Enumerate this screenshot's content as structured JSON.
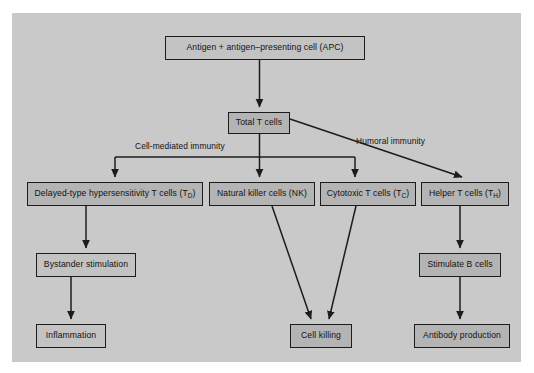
{
  "diagram": {
    "canvas_color": "#c9c9c9",
    "page_color": "#ffffff",
    "node_fill": "#b4b4b4",
    "node_border": "#1c1c1c",
    "text_color": "#111111"
  },
  "nodes": {
    "apc": {
      "label": "Antigen + antigen–presenting cell (APC)",
      "x": 165,
      "y": 36,
      "w": 200,
      "h": 24
    },
    "total_t": {
      "label": "Total T cells",
      "x": 228,
      "y": 112,
      "w": 62,
      "h": 22
    },
    "delayed_type": {
      "label_main": "Delayed-type hypersensitivity T cells (T",
      "label_sub": "D",
      "label_tail": ")",
      "label_full": "Delayed-type hypersensitivity T cells (TD)",
      "x": 27,
      "y": 182,
      "w": 176,
      "h": 24
    },
    "natural_killer": {
      "label": "Natural killer cells (NK)",
      "x": 209,
      "y": 182,
      "w": 106,
      "h": 24
    },
    "cytotoxic": {
      "label_main": "Cytotoxic T cells (T",
      "label_sub": "C",
      "label_tail": ")",
      "label_full": "Cytotoxic T cells (TC)",
      "x": 320,
      "y": 182,
      "w": 96,
      "h": 24
    },
    "helper": {
      "label_main": "Helper T cells (T",
      "label_sub": "H",
      "label_tail": ")",
      "label_full": "Helper T cells (TH)",
      "x": 421,
      "y": 182,
      "w": 88,
      "h": 24
    },
    "bystander": {
      "label": "Bystander stimulation",
      "x": 36,
      "y": 253,
      "w": 100,
      "h": 24
    },
    "stimulate_b": {
      "label": "Stimulate B cells",
      "x": 419,
      "y": 253,
      "w": 82,
      "h": 24
    },
    "inflammation": {
      "label": "Inflammation",
      "x": 36,
      "y": 324,
      "w": 70,
      "h": 24
    },
    "cell_killing": {
      "label": "Cell killing",
      "x": 290,
      "y": 324,
      "w": 62,
      "h": 24
    },
    "antibody": {
      "label": "Antibody production",
      "x": 414,
      "y": 324,
      "w": 96,
      "h": 24
    }
  },
  "edge_labels": {
    "cell_mediated": {
      "text": "Cell-mediated immunity",
      "x": 135,
      "y": 141
    },
    "humoral": {
      "text": "Humoral immunity",
      "x": 356,
      "y": 136
    }
  }
}
